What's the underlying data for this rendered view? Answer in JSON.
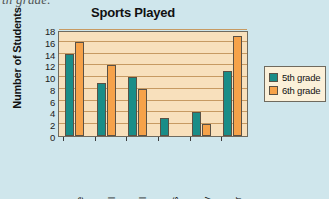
{
  "page": {
    "clipped_text_above": "th grade."
  },
  "chart_data": {
    "type": "bar",
    "title": "Sports Played",
    "xlabel": "",
    "ylabel": "Number of Students",
    "categories": [
      "Lacrosse",
      "Football",
      "Basketball",
      "Tennis",
      "Hockey",
      "Soccer"
    ],
    "series": [
      {
        "name": "5th grade",
        "color": "#1a8d88",
        "values": [
          14,
          9,
          10,
          3,
          4,
          11
        ]
      },
      {
        "name": "6th grade",
        "color": "#f6a24a",
        "values": [
          16,
          12,
          8,
          0,
          2,
          17
        ]
      }
    ],
    "ylim": [
      0,
      18
    ],
    "yticks": [
      0,
      2,
      4,
      6,
      8,
      10,
      12,
      14,
      16,
      18
    ],
    "grid": true,
    "legend_position": "right",
    "plot_background": "#f8e0bc",
    "page_background": "#cfe6ec",
    "gridline_color": "#c79a62"
  }
}
